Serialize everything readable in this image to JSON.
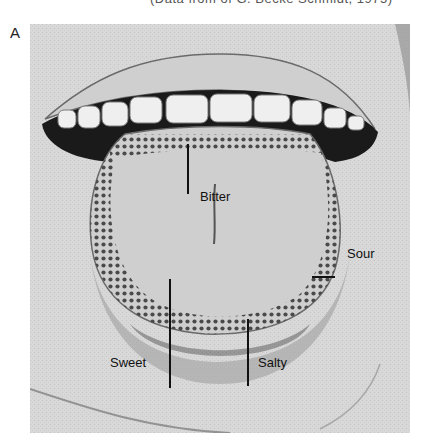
{
  "figure": {
    "panel_letter": "A",
    "caption_top_partial": "(Data from of G. Becke Schmidt, 1975)",
    "labels": {
      "bitter": "Bitter",
      "sour": "Sour",
      "sweet": "Sweet",
      "salty": "Salty"
    },
    "colors": {
      "background": "#d6d6d6",
      "mouth_dark": "#1a1a1a",
      "teeth": "#efefef",
      "tongue": "#c9c9c9",
      "dots": "#4a4a4a",
      "label_text": "#111111"
    }
  }
}
